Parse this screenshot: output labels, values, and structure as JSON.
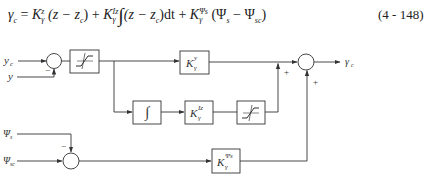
{
  "equation": {
    "lhs": "γ",
    "lhs_sub": "c",
    "terms": [
      {
        "coef": "K",
        "sup": "z",
        "sub": "γ",
        "expr": "(z − z",
        "expr_sub": "c",
        "expr_end": ")"
      },
      {
        "coef": "K",
        "sup": "Iz",
        "sub": "γ",
        "integral": "∫",
        "expr": "(z − z",
        "expr_sub": "c",
        "expr_end": ")dt"
      },
      {
        "coef": "K",
        "sup": "Ψs",
        "sub": "γ",
        "expr": "(Ψ",
        "expr_sub": "s",
        "expr_mid": " − Ψ",
        "expr_sub2": "sc",
        "expr_end": ")"
      }
    ],
    "equals": "=",
    "plus": "+",
    "number": "(4 - 148)"
  },
  "diagram": {
    "inputs": {
      "y_c": "y",
      "y_c_sub": "c",
      "y": "y",
      "psi_s": "Ψ",
      "psi_s_sub": "s",
      "psi_sc": "Ψ",
      "psi_sc_sub": "sc"
    },
    "output": {
      "label": "γ",
      "sub": "c"
    },
    "blocks": {
      "saturation1": "saturation",
      "k_y": {
        "K": "K",
        "sup": "y",
        "sub": "γ"
      },
      "integrator": "∫",
      "k_iz": {
        "K": "K",
        "sup": "Iz",
        "sub": "γ"
      },
      "saturation2": "saturation",
      "k_psi": {
        "K": "K",
        "sup": "Ψs",
        "sub": "γ"
      }
    },
    "signs": {
      "sum1_minus": "−",
      "sum2_minus": "−",
      "out_plus_left": "+",
      "out_plus_bottom": "+"
    },
    "colors": {
      "line": "#333333",
      "background": "#ffffff"
    }
  }
}
